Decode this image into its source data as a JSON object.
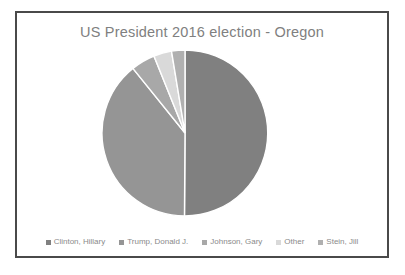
{
  "chart_data": {
    "type": "pie",
    "title": "US President 2016 election - Oregon",
    "xlabel": "",
    "ylabel": "",
    "legend_position": "bottom",
    "grid": false,
    "categories": [
      "Clinton, Hillary",
      "Trump, Donald J.",
      "Johnson, Gary",
      "Other",
      "Stein, Jill"
    ],
    "values": [
      50.1,
      39.1,
      4.7,
      3.5,
      2.6
    ],
    "slices": [
      {
        "label": "Clinton, Hillary",
        "value": 50.1,
        "color": "#808080"
      },
      {
        "label": "Trump, Donald J.",
        "value": 39.1,
        "color": "#959595"
      },
      {
        "label": "Johnson, Gary",
        "value": 4.7,
        "color": "#a8a8a8"
      },
      {
        "label": "Other",
        "value": 3.5,
        "color": "#d9d9d9"
      },
      {
        "label": "Stein, Jill",
        "value": 2.6,
        "color": "#b0b0b0"
      }
    ]
  },
  "legend": {
    "items": [
      {
        "label": "Clinton, Hillary",
        "color": "#808080"
      },
      {
        "label": "Trump, Donald J.",
        "color": "#959595"
      },
      {
        "label": "Johnson, Gary",
        "color": "#a8a8a8"
      },
      {
        "label": "Other",
        "color": "#d9d9d9"
      },
      {
        "label": "Stein, Jill",
        "color": "#b0b0b0"
      }
    ]
  },
  "style": {
    "frame_border_color": "#4a4a4a",
    "background": "#ffffff",
    "title_color": "#808080",
    "legend_text_color": "#8a8a8a",
    "slice_separator_color": "#ffffff"
  }
}
